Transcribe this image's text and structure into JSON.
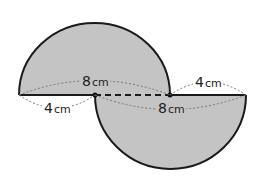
{
  "diagram": {
    "shapes": [
      {
        "name": "upper-semicircle",
        "diameter_label": "8",
        "unit": "cm"
      },
      {
        "name": "lower-semicircle",
        "diameter_label": "8",
        "unit": "cm"
      }
    ],
    "labels": {
      "upper_diameter_num": "8",
      "upper_diameter_unit": "cm",
      "lower_diameter_num": "8",
      "lower_diameter_unit": "cm",
      "left_offset_num": "4",
      "left_offset_unit": "cm",
      "right_offset_num": "4",
      "right_offset_unit": "cm"
    },
    "colors": {
      "fill": "#c4c4c4",
      "stroke": "#1a1a1a",
      "dim_line": "#777777"
    }
  }
}
